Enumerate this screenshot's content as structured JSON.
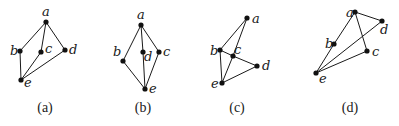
{
  "diagrams": [
    {
      "caption": "(a)",
      "caption_pos": [
        45,
        112
      ],
      "nodes": [
        {
          "id": "a",
          "label": "a",
          "x": 46,
          "y": 22,
          "lx": 42,
          "ly": 16
        },
        {
          "id": "b",
          "label": "b",
          "x": 20,
          "y": 51,
          "lx": 10,
          "ly": 55
        },
        {
          "id": "c",
          "label": "c",
          "x": 41,
          "y": 52,
          "lx": 45,
          "ly": 53
        },
        {
          "id": "d",
          "label": "d",
          "x": 65,
          "y": 50,
          "lx": 69,
          "ly": 54
        },
        {
          "id": "e",
          "label": "e",
          "x": 21,
          "y": 80,
          "lx": 24,
          "ly": 87
        }
      ],
      "edges": [
        [
          "a",
          "b"
        ],
        [
          "a",
          "c"
        ],
        [
          "a",
          "d"
        ],
        [
          "b",
          "e"
        ],
        [
          "c",
          "e"
        ],
        [
          "d",
          "e"
        ]
      ]
    },
    {
      "caption": "(b)",
      "caption_pos": [
        143,
        112
      ],
      "nodes": [
        {
          "id": "a",
          "label": "a",
          "x": 141,
          "y": 25,
          "lx": 137,
          "ly": 19
        },
        {
          "id": "b",
          "label": "b",
          "x": 123,
          "y": 61,
          "lx": 113,
          "ly": 56
        },
        {
          "id": "d",
          "label": "d",
          "x": 143,
          "y": 52,
          "lx": 144,
          "ly": 61
        },
        {
          "id": "c",
          "label": "c",
          "x": 159,
          "y": 52,
          "lx": 163,
          "ly": 56
        },
        {
          "id": "e",
          "label": "e",
          "x": 145,
          "y": 89,
          "lx": 149,
          "ly": 93
        }
      ],
      "edges": [
        [
          "a",
          "b"
        ],
        [
          "a",
          "d"
        ],
        [
          "a",
          "c"
        ],
        [
          "b",
          "e"
        ],
        [
          "d",
          "e"
        ],
        [
          "c",
          "e"
        ]
      ]
    },
    {
      "caption": "(c)",
      "caption_pos": [
        237,
        112
      ],
      "nodes": [
        {
          "id": "a",
          "label": "a",
          "x": 247,
          "y": 18,
          "lx": 252,
          "ly": 23
        },
        {
          "id": "b",
          "label": "b",
          "x": 220,
          "y": 50,
          "lx": 210,
          "ly": 55
        },
        {
          "id": "c",
          "label": "c",
          "x": 233,
          "y": 56,
          "lx": 234,
          "ly": 54
        },
        {
          "id": "d",
          "label": "d",
          "x": 257,
          "y": 66,
          "lx": 262,
          "ly": 70
        },
        {
          "id": "e",
          "label": "e",
          "x": 222,
          "y": 83,
          "lx": 211,
          "ly": 88
        }
      ],
      "edges": [
        [
          "a",
          "b"
        ],
        [
          "a",
          "c"
        ],
        [
          "c",
          "e"
        ],
        [
          "b",
          "c"
        ],
        [
          "c",
          "d"
        ],
        [
          "b",
          "e"
        ],
        [
          "d",
          "e"
        ]
      ]
    },
    {
      "caption": "(d)",
      "caption_pos": [
        350,
        112
      ],
      "nodes": [
        {
          "id": "a",
          "label": "a",
          "x": 355,
          "y": 12,
          "lx": 346,
          "ly": 17
        },
        {
          "id": "d",
          "label": "d",
          "x": 382,
          "y": 21,
          "lx": 380,
          "ly": 34
        },
        {
          "id": "b",
          "label": "b",
          "x": 334,
          "y": 44,
          "lx": 325,
          "ly": 48
        },
        {
          "id": "c",
          "label": "c",
          "x": 367,
          "y": 51,
          "lx": 372,
          "ly": 56
        },
        {
          "id": "e",
          "label": "e",
          "x": 316,
          "y": 73,
          "lx": 319,
          "ly": 83
        }
      ],
      "edges": [
        [
          "a",
          "d"
        ],
        [
          "a",
          "b"
        ],
        [
          "b",
          "e"
        ],
        [
          "a",
          "c"
        ],
        [
          "c",
          "e"
        ],
        [
          "d",
          "e"
        ]
      ]
    }
  ],
  "colors": {
    "ink": "#1a1a1a",
    "node": "#111111",
    "background": "#ffffff"
  }
}
